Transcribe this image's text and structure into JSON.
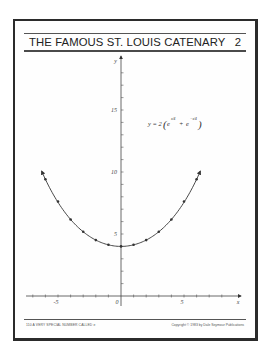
{
  "page": {
    "title": "THE FAMOUS ST. LOUIS CATENARY",
    "page_number": "2",
    "footer_left": "110  A VERY SPECIAL NUMBER CALLED e",
    "footer_right": "Copyright © 1983 by Dale Seymour Publications"
  },
  "equation": {
    "lhs": "y = 2",
    "term1_base": "e",
    "term1_exp": "x/4",
    "plus": "+",
    "term2_base": "e",
    "term2_exp": "−x/4",
    "full": "y = 2(e^(x/4) + e^(−x/4))"
  },
  "chart_data": {
    "type": "line",
    "title": "THE FAMOUS ST. LOUIS CATENARY",
    "equation": "y = 2(e^(x/4) + e^(-x/4))",
    "xlabel": "x",
    "ylabel": "y",
    "xlim": [
      -8,
      9
    ],
    "ylim": [
      0,
      19
    ],
    "x_ticks": [
      -7,
      -6,
      -5,
      -4,
      -3,
      -2,
      -1,
      0,
      1,
      2,
      3,
      4,
      5,
      6,
      7,
      8,
      9
    ],
    "x_tick_labels": [
      {
        "value": -5,
        "label": "-5"
      },
      {
        "value": 0,
        "label": "0"
      },
      {
        "value": 5,
        "label": "5"
      },
      {
        "value": 9,
        "label": "x"
      }
    ],
    "y_tick_labels": [
      {
        "value": 5,
        "label": "5"
      },
      {
        "value": 10,
        "label": "10"
      },
      {
        "value": 15,
        "label": "15"
      },
      {
        "value": 19,
        "label": "y"
      }
    ],
    "grid": false,
    "legend": null,
    "series": [
      {
        "name": "catenary",
        "curve_range": [
          -6.3,
          6.3
        ],
        "arrows_at_ends": true,
        "marked_points": [
          {
            "x": -6,
            "y": 9.41
          },
          {
            "x": -5,
            "y": 7.62
          },
          {
            "x": -4,
            "y": 6.17
          },
          {
            "x": -3,
            "y": 5.18
          },
          {
            "x": -2,
            "y": 4.51
          },
          {
            "x": -1,
            "y": 4.13
          },
          {
            "x": 0,
            "y": 4.0
          },
          {
            "x": 1,
            "y": 4.13
          },
          {
            "x": 2,
            "y": 4.51
          },
          {
            "x": 3,
            "y": 5.18
          },
          {
            "x": 4,
            "y": 6.17
          },
          {
            "x": 5,
            "y": 7.62
          },
          {
            "x": 6,
            "y": 9.41
          }
        ]
      }
    ]
  },
  "colors": {
    "ink": "#2a2a2a",
    "frame": "#2b2b2b",
    "paper": "#ffffff"
  }
}
